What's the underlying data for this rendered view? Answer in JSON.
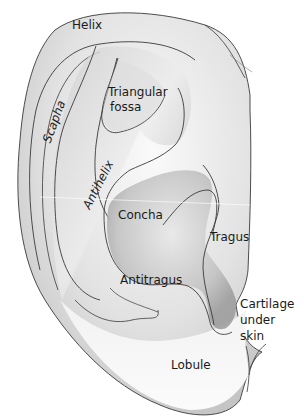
{
  "diagram": {
    "labels": {
      "helix": "Helix",
      "triangular_fossa_line1": "Triangular",
      "triangular_fossa_line2": "fossa",
      "scapha": "Scapha",
      "antihelix": "Antihelix",
      "concha": "Concha",
      "tragus": "Tragus",
      "antitragus": "Antitragus",
      "cartilage_line1": "Cartilage",
      "cartilage_line2": "under",
      "cartilage_line3": "skin",
      "lobule": "Lobule"
    },
    "colors": {
      "outline": "#3a3a3a",
      "skin_light": "#f4f4f4",
      "skin_mid": "#d6d6d6",
      "skin_dark": "#9c9c9c",
      "text": "#1a1a1a",
      "background": "#ffffff"
    }
  }
}
